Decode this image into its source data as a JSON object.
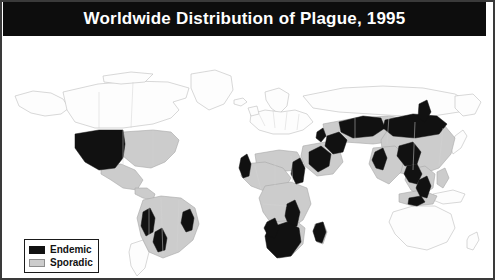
{
  "figure": {
    "title": "Worldwide Distribution of Plague, 1995",
    "title_bar_color": "#0d0d0d",
    "title_text_color": "#ffffff",
    "frame_color": "#3a3a3a",
    "background_color": "#ffffff"
  },
  "legend": {
    "items": [
      {
        "label": "Endemic",
        "color": "#111111",
        "swatch_name": "endemic-swatch"
      },
      {
        "label": "Sporadic",
        "color": "#cccccc",
        "swatch_name": "sporadic-swatch"
      }
    ]
  },
  "map": {
    "projection_note": "world map, equirectangular",
    "coastline_color": "#b8b8b8",
    "country_border_color": "#c9c9c9",
    "ocean_color": "#ffffff",
    "no_plague_color": "#ffffff",
    "regions": {
      "endemic": [
        "Western United States",
        "Peru",
        "Bolivia",
        "Brazil (northeast)",
        "Northwest Africa",
        "Libya / Sudan border area",
        "East Africa (Kenya, Uganda, Tanzania)",
        "Southern Africa (Zambia, Zimbabwe, Botswana, Namibia)",
        "Madagascar",
        "Arabian Peninsula",
        "Iran / Caspian region",
        "Kazakhstan / Central Asia",
        "Mongolia",
        "China (inner regions)",
        "India (west)",
        "Myanmar / Vietnam",
        "Indonesia (Java)"
      ],
      "sporadic": [
        "Eastern United States",
        "Mexico",
        "South America (most)",
        "Sub-Saharan Africa",
        "Middle East",
        "Russia (south)",
        "China",
        "Southeast Asia",
        "India"
      ]
    }
  }
}
